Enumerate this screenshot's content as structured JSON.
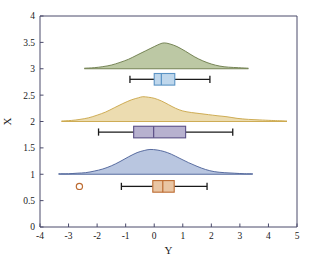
{
  "chart_data": {
    "type": "area",
    "title": "",
    "subtitle": "",
    "xlabel": "Y",
    "ylabel": "X",
    "xlim": [
      -4,
      5
    ],
    "ylim": [
      0,
      4
    ],
    "grid": false,
    "legend": "none",
    "xticks": [
      "-4",
      "-3",
      "-2",
      "-1",
      "0",
      "1",
      "2",
      "3",
      "4",
      "5"
    ],
    "xtick_values": [
      -4,
      -3,
      -2,
      -1,
      0,
      1,
      2,
      3,
      4,
      5
    ],
    "yticks": [
      "0",
      "0.5",
      "1",
      "1.5",
      "2",
      "2.5",
      "3",
      "3.5",
      "4"
    ],
    "ytick_values": [
      0,
      0.5,
      1,
      1.5,
      2,
      2.5,
      3,
      3.5,
      4
    ],
    "plot_kind": "raincloud",
    "series": [
      {
        "name": "group-3",
        "baseline": 3.0,
        "kde": {
          "peak_x": 0.35,
          "peak_y": 3.49,
          "x_start": -2.45,
          "x_end": 3.3,
          "fill": "#bcc8a4",
          "stroke": "#6b7a4a",
          "points": [
            [
              -2.45,
              3.01
            ],
            [
              -2.1,
              3.02
            ],
            [
              -1.8,
              3.04
            ],
            [
              -1.5,
              3.07
            ],
            [
              -1.2,
              3.12
            ],
            [
              -0.9,
              3.18
            ],
            [
              -0.6,
              3.26
            ],
            [
              -0.3,
              3.34
            ],
            [
              0.0,
              3.42
            ],
            [
              0.2,
              3.47
            ],
            [
              0.35,
              3.49
            ],
            [
              0.55,
              3.47
            ],
            [
              0.8,
              3.42
            ],
            [
              1.1,
              3.33
            ],
            [
              1.4,
              3.23
            ],
            [
              1.7,
              3.15
            ],
            [
              2.0,
              3.09
            ],
            [
              2.3,
              3.05
            ],
            [
              2.6,
              3.03
            ],
            [
              2.95,
              3.02
            ],
            [
              3.3,
              3.01
            ]
          ]
        },
        "box": {
          "center_y": 2.8,
          "height": 0.22,
          "q1": 0.0,
          "median": 0.25,
          "q3": 0.72,
          "whisker_low": -0.85,
          "whisker_high": 1.95,
          "fill": "#bfd7ec",
          "stroke": "#5b93c4",
          "median_color": "#5b93c4",
          "outliers": []
        }
      },
      {
        "name": "group-2",
        "baseline": 2.0,
        "kde": {
          "peak_x": -0.4,
          "peak_y": 2.47,
          "x_start": -3.25,
          "x_end": 4.65,
          "fill": "#ecdcb0",
          "stroke": "#c9a546",
          "points": [
            [
              -3.25,
              2.01
            ],
            [
              -2.9,
              2.02
            ],
            [
              -2.6,
              2.04
            ],
            [
              -2.3,
              2.07
            ],
            [
              -2.0,
              2.12
            ],
            [
              -1.7,
              2.18
            ],
            [
              -1.4,
              2.26
            ],
            [
              -1.1,
              2.34
            ],
            [
              -0.8,
              2.41
            ],
            [
              -0.55,
              2.45
            ],
            [
              -0.4,
              2.47
            ],
            [
              -0.2,
              2.46
            ],
            [
              0.0,
              2.44
            ],
            [
              0.25,
              2.39
            ],
            [
              0.5,
              2.32
            ],
            [
              0.75,
              2.25
            ],
            [
              1.0,
              2.2
            ],
            [
              1.3,
              2.17
            ],
            [
              1.6,
              2.15
            ],
            [
              1.9,
              2.13
            ],
            [
              2.2,
              2.11
            ],
            [
              2.55,
              2.09
            ],
            [
              2.9,
              2.06
            ],
            [
              3.3,
              2.04
            ],
            [
              3.7,
              2.03
            ],
            [
              4.1,
              2.02
            ],
            [
              4.65,
              2.01
            ]
          ]
        },
        "box": {
          "center_y": 1.8,
          "height": 0.22,
          "q1": -0.72,
          "median": -0.02,
          "q3": 1.1,
          "whisker_low": -1.95,
          "whisker_high": 2.75,
          "fill": "#b7b1cf",
          "stroke": "#5b4f86",
          "median_color": "#5b4f86",
          "outliers": []
        }
      },
      {
        "name": "group-1",
        "baseline": 1.0,
        "kde": {
          "peak_x": -0.15,
          "peak_y": 1.47,
          "x_start": -3.35,
          "x_end": 3.45,
          "fill": "#b9c6e0",
          "stroke": "#4a5f96",
          "points": [
            [
              -3.35,
              1.01
            ],
            [
              -3.0,
              1.01
            ],
            [
              -2.7,
              1.02
            ],
            [
              -2.4,
              1.03
            ],
            [
              -2.1,
              1.06
            ],
            [
              -1.8,
              1.1
            ],
            [
              -1.5,
              1.16
            ],
            [
              -1.2,
              1.24
            ],
            [
              -0.9,
              1.33
            ],
            [
              -0.6,
              1.41
            ],
            [
              -0.35,
              1.45
            ],
            [
              -0.15,
              1.47
            ],
            [
              0.1,
              1.46
            ],
            [
              0.35,
              1.43
            ],
            [
              0.6,
              1.38
            ],
            [
              0.9,
              1.3
            ],
            [
              1.2,
              1.22
            ],
            [
              1.5,
              1.15
            ],
            [
              1.8,
              1.09
            ],
            [
              2.1,
              1.05
            ],
            [
              2.45,
              1.03
            ],
            [
              2.8,
              1.02
            ],
            [
              3.15,
              1.01
            ],
            [
              3.45,
              1.01
            ]
          ]
        },
        "box": {
          "center_y": 0.77,
          "height": 0.22,
          "q1": -0.05,
          "median": 0.3,
          "q3": 0.7,
          "whisker_low": -1.15,
          "whisker_high": 1.85,
          "fill": "#e9c5a3",
          "stroke": "#bd6c32",
          "median_color": "#bd6c32",
          "outliers": [
            -2.62
          ]
        }
      }
    ]
  },
  "axes": {
    "xlabel": "Y",
    "ylabel": "X"
  }
}
